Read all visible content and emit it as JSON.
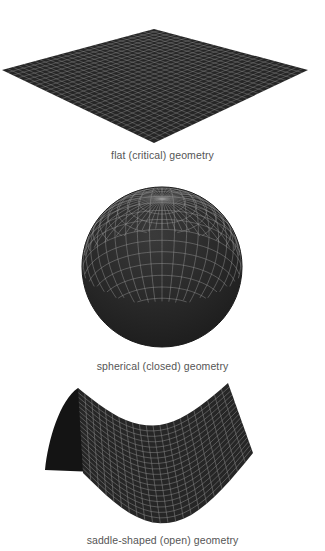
{
  "panels": [
    {
      "id": "flat",
      "caption": "flat (critical) geometry"
    },
    {
      "id": "spherical",
      "caption": "spherical (closed) geometry"
    },
    {
      "id": "saddle",
      "caption": "saddle-shaped (open) geometry"
    }
  ],
  "colors": {
    "surface": "#262626",
    "grid": "#9a9a9a",
    "caption": "#555555",
    "background": "#ffffff"
  }
}
